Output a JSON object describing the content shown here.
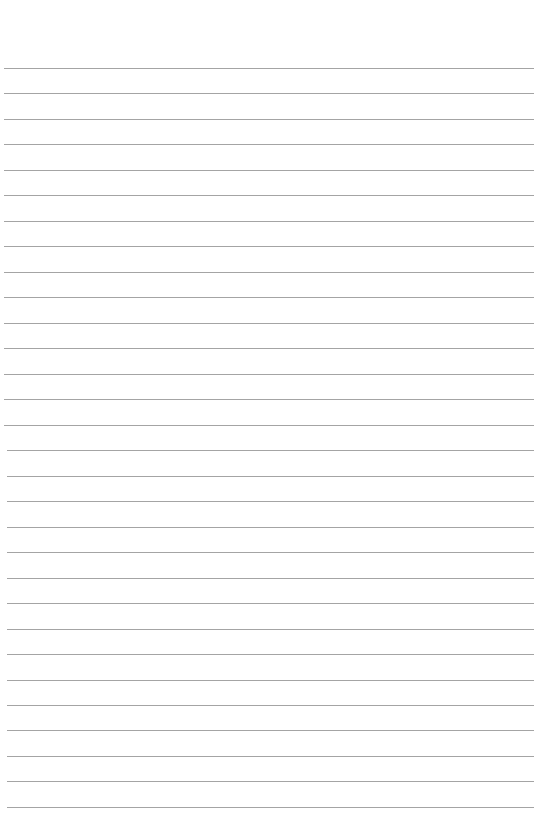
{
  "page": {
    "type": "lined-paper",
    "background_color": "#ffffff",
    "rule_color": "#a4a4a4",
    "rule_count": 30,
    "first_rule_y": 68,
    "rule_spacing": 25.48,
    "rule_left": 4,
    "rule_right": 534
  }
}
